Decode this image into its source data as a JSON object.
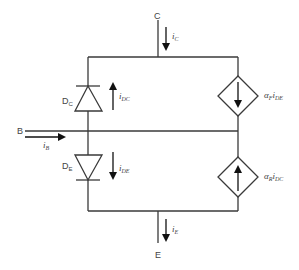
{
  "diagram": {
    "colors": {
      "wire": "#3a3a3a",
      "arrow": "#111111",
      "text": "#444444",
      "background": "#ffffff"
    },
    "terminals": {
      "collector": {
        "label": "C"
      },
      "base": {
        "label": "B"
      },
      "emitter": {
        "label": "E"
      }
    },
    "currents": {
      "collector": {
        "symbol": "i",
        "sub": "C"
      },
      "base": {
        "symbol": "i",
        "sub": "B"
      },
      "emitter": {
        "symbol": "i",
        "sub": "E"
      },
      "diode_collector": {
        "symbol": "i",
        "sub": "DC",
        "direction": "up"
      },
      "diode_emitter": {
        "symbol": "i",
        "sub": "DE",
        "direction": "down"
      }
    },
    "diodes": {
      "collector_diode": {
        "label": "D",
        "sub": "C",
        "orientation": "anode-bottom (points up)"
      },
      "emitter_diode": {
        "label": "D",
        "sub": "E",
        "orientation": "anode-top (points down)"
      }
    },
    "sources": {
      "forward_source": {
        "alpha": "α",
        "alpha_sub": "F",
        "current": "i",
        "current_sub": "DE",
        "direction": "down"
      },
      "reverse_source": {
        "alpha": "α",
        "alpha_sub": "R",
        "current": "i",
        "current_sub": "DC",
        "direction": "up"
      }
    }
  }
}
